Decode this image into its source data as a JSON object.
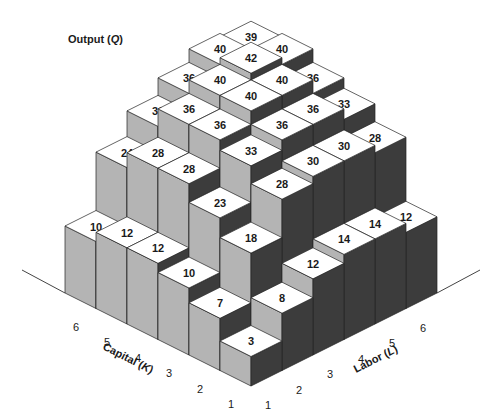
{
  "chart_data": {
    "type": "3d-bar",
    "title": "Output (Q)",
    "title_parts": {
      "prefix": "Output (",
      "var": "Q",
      "suffix": ")"
    },
    "x_axis": {
      "label": "Capital (K)",
      "label_prefix": "Capital (",
      "label_var": "K",
      "label_suffix": ")",
      "ticks": [
        "1",
        "2",
        "3",
        "4",
        "5",
        "6"
      ]
    },
    "y_axis": {
      "label": "Labor (L)",
      "label_prefix": "Labor (",
      "label_var": "L",
      "label_suffix": ")",
      "ticks": [
        "1",
        "2",
        "3",
        "4",
        "5",
        "6"
      ]
    },
    "z_axis": {
      "label": "Output (Q)"
    },
    "rows_key": "capital",
    "cols_key": "labor",
    "values": [
      [
        3,
        8,
        12,
        14,
        14,
        12
      ],
      [
        7,
        18,
        28,
        30,
        30,
        28
      ],
      [
        10,
        23,
        33,
        36,
        36,
        33
      ],
      [
        12,
        28,
        36,
        40,
        40,
        36
      ],
      [
        12,
        28,
        36,
        40,
        42,
        40
      ],
      [
        10,
        24,
        31,
        36,
        40,
        39
      ]
    ],
    "value_note": "values[K-1][L-1] = output for capital K and labor L",
    "grid": false,
    "legend": null
  },
  "colors": {
    "top_face": "#ffffff",
    "left_face": "#b4b4b4",
    "right_face": "#3c3c3c",
    "edge": "#222222",
    "axis_line": "#444444",
    "text": "#1a1a1a"
  }
}
